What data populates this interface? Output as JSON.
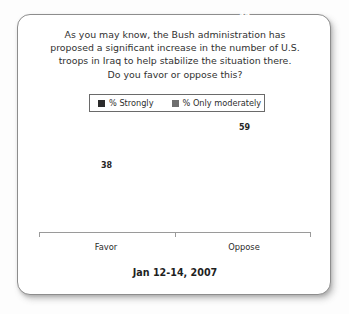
{
  "card": {
    "background": "#ffffff",
    "border_color": "#8d8d8d"
  },
  "question": {
    "lines": [
      "As you may know, the Bush administration has",
      "proposed a significant increase in the number of U.S.",
      "troops in Iraq to help stabilize the situation there.",
      "Do you favor or oppose this?"
    ]
  },
  "legend": {
    "items": [
      {
        "label": "% Strongly",
        "color": "#2b2b2b",
        "swatch_icon": "square-swatch-icon"
      },
      {
        "label": "% Only moderately",
        "color": "#6e6e6e",
        "swatch_icon": "square-swatch-icon"
      }
    ]
  },
  "footer": {
    "date": "Jan 12-14, 2007"
  },
  "chart_data": {
    "type": "bar",
    "title": "As you may know, the Bush administration has proposed a significant increase in the number of U.S. troops in Iraq to help stabilize the situation there. Do you favor or oppose this?",
    "subtitle": "Jan 12-14, 2007",
    "stacked": true,
    "xlabel": "",
    "ylabel": "",
    "ylim": [
      0,
      70
    ],
    "grid": false,
    "legend_position": "top-center",
    "categories": [
      "Favor",
      "Oppose"
    ],
    "series": [
      {
        "name": "% Strongly",
        "color": "#2b2b2b",
        "values": [
          19,
          15
        ]
      },
      {
        "name": "% Only moderately",
        "color": "#6e6e6e",
        "values": [
          19,
          44
        ]
      }
    ],
    "totals": [
      38,
      59
    ],
    "bars": [
      {
        "category": "Favor",
        "total": 38,
        "total_label": "38",
        "segments": [
          {
            "name": "% Only moderately",
            "value": 19,
            "label": "19",
            "color": "#6e6e6e"
          },
          {
            "name": "% Strongly",
            "value": 19,
            "label": "19",
            "color": "#2b2b2b"
          }
        ]
      },
      {
        "category": "Oppose",
        "total": 59,
        "total_label": "59",
        "segments": [
          {
            "name": "% Only moderately",
            "value": 44,
            "label": "44",
            "color": "#6e6e6e"
          },
          {
            "name": "% Strongly",
            "value": 15,
            "label": "15",
            "color": "#2b2b2b"
          }
        ]
      }
    ]
  }
}
